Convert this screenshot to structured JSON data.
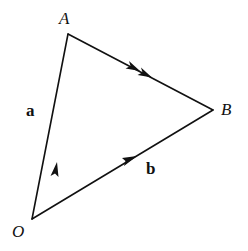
{
  "diagram": {
    "type": "vector-triangle",
    "points": {
      "O": {
        "label": "O",
        "x": 32,
        "y": 219
      },
      "A": {
        "label": "A",
        "x": 68,
        "y": 34
      },
      "B": {
        "label": "B",
        "x": 213,
        "y": 110
      }
    },
    "edges": [
      {
        "from": "O",
        "to": "A",
        "vector_label": "a",
        "arrowheads": 1
      },
      {
        "from": "O",
        "to": "B",
        "vector_label": "b",
        "arrowheads": 1
      },
      {
        "from": "A",
        "to": "B",
        "vector_label": "",
        "arrowheads": 2
      }
    ],
    "labels": {
      "O": "O",
      "A": "A",
      "B": "B",
      "a": "a",
      "b": "b"
    },
    "colors": {
      "line": "#111111",
      "background": "#ffffff"
    }
  }
}
